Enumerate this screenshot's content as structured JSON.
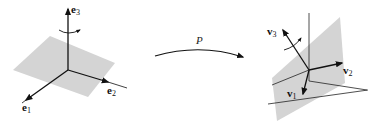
{
  "figure": {
    "left": {
      "basis": [
        {
          "name": "e",
          "sub": "1"
        },
        {
          "name": "e",
          "sub": "2"
        },
        {
          "name": "e",
          "sub": "3"
        }
      ],
      "plane_color": "#d4d4d4"
    },
    "map": {
      "label": "P"
    },
    "right": {
      "basis": [
        {
          "name": "v",
          "sub": "1"
        },
        {
          "name": "v",
          "sub": "2"
        },
        {
          "name": "v",
          "sub": "3"
        }
      ],
      "plane_color": "#d4d4d4"
    }
  }
}
